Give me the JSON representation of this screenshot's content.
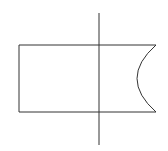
{
  "diagram": {
    "stroke_color": "#333333",
    "background": "#ffffff",
    "shape": {
      "left": 19,
      "top": 45,
      "right": 156,
      "bottom": 112,
      "arc_leftmost_x": 137
    },
    "axis_line": {
      "x": 99,
      "y1": 13,
      "y2": 145
    }
  }
}
